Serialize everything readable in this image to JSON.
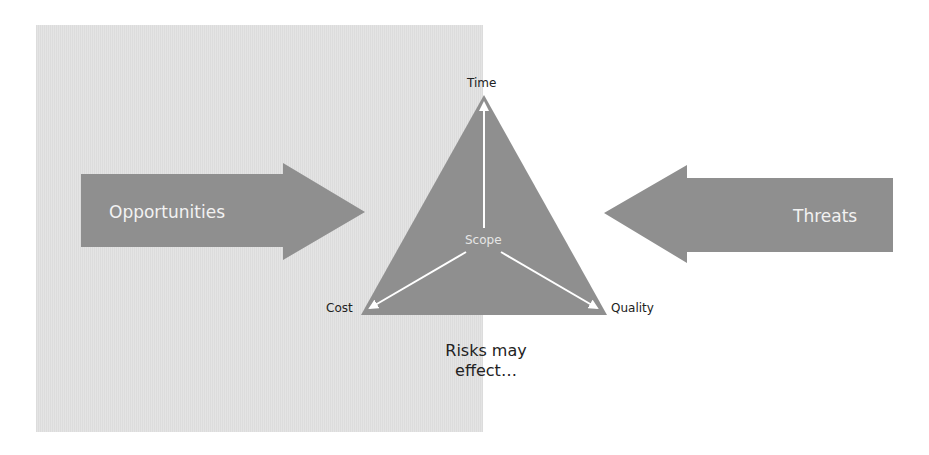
{
  "colors": {
    "shape_fill": "#8f8f8f",
    "panel_fill": "#e0e0e0",
    "arrow_line": "#ffffff",
    "label_text": "#222222"
  },
  "left_arrow": {
    "label": "Opportunities",
    "direction": "right"
  },
  "right_arrow": {
    "label": "Threats",
    "direction": "left"
  },
  "triangle": {
    "center_label": "Scope",
    "vertices": {
      "top": "Time",
      "bottom_left": "Cost",
      "bottom_right": "Quality"
    }
  },
  "caption": {
    "line1": "Risks may",
    "line2": "effect…"
  }
}
